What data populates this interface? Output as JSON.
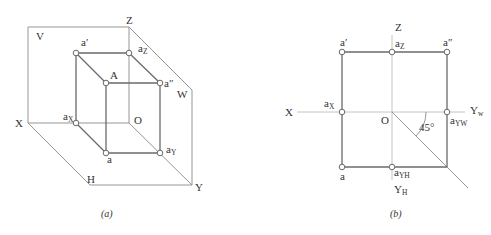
{
  "figure_a": {
    "caption": "(a)",
    "planes": {
      "V": "V",
      "H": "H",
      "W": "W"
    },
    "axes": {
      "X": "X",
      "Z": "Z",
      "Y": "Y",
      "O": "O"
    },
    "points": {
      "A": "A",
      "a_prime": "a′",
      "a_double_prime": "a″",
      "a": "a",
      "aX_base": "a",
      "aX_sub": "X",
      "aZ_base": "a",
      "aZ_sub": "Z",
      "aY_base": "a",
      "aY_sub": "Y"
    }
  },
  "figure_b": {
    "caption": "(b)",
    "axes": {
      "X": "X",
      "Z": "Z",
      "O": "O",
      "YW_base": "Y",
      "YW_sub": "w",
      "YH_base": "Y",
      "YH_sub": "H"
    },
    "points": {
      "a_prime": "a′",
      "a_double_prime": "a″",
      "a": "a",
      "aX_base": "a",
      "aX_sub": "X",
      "aZ_base": "a",
      "aZ_sub": "Z",
      "aYW_base": "a",
      "aYW_sub": "YW",
      "aYH_base": "a",
      "aYH_sub": "YH"
    },
    "angle_label": "45°"
  }
}
